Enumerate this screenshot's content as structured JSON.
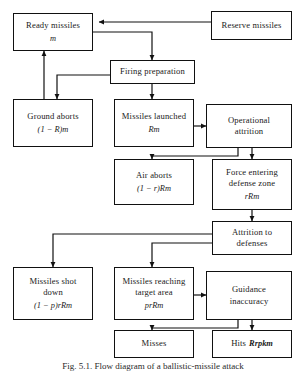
{
  "figure": {
    "caption_prefix": "Fig. 5.1.",
    "caption_text": "Flow diagram of a ballistic-missile attack",
    "background_color": "#ffffff",
    "line_color": "#111111"
  },
  "nodes": {
    "ready_missiles": {
      "label": "Ready missiles",
      "formula": "m"
    },
    "reserve_missiles": {
      "label": "Reserve missiles",
      "formula": ""
    },
    "firing_preparation": {
      "label": "Firing preparation",
      "formula": ""
    },
    "ground_aborts": {
      "label": "Ground aborts",
      "formula": "(1 − R)m"
    },
    "missiles_launched": {
      "label": "Missiles launched",
      "formula": "Rm"
    },
    "operational_attrition": {
      "label_line1": "Operational",
      "label_line2": "attrition",
      "formula": ""
    },
    "air_aborts": {
      "label": "Air aborts",
      "formula": "(1 − r)Rm"
    },
    "force_entering_defense_zone": {
      "label_line1": "Force entering",
      "label_line2": "defense zone",
      "formula": "rRm"
    },
    "attrition_to_defenses": {
      "label_line1": "Attrition to",
      "label_line2": "defenses",
      "formula": ""
    },
    "missiles_shot_down": {
      "label_line1": "Missiles shot",
      "label_line2": "down",
      "formula": "(1 − p)rRm"
    },
    "missiles_reaching_target_area": {
      "label_line1": "Missiles reaching",
      "label_line2": "target area",
      "formula": "prRm"
    },
    "guidance_inaccuracy": {
      "label_line1": "Guidance",
      "label_line2": "inaccuracy",
      "formula": ""
    },
    "misses": {
      "label": "Misses",
      "formula": ""
    },
    "hits": {
      "label": "Hits",
      "formula": "Rrpkm"
    }
  },
  "edges": [
    {
      "name": "reserve-to-ready",
      "from": "reserve_missiles",
      "to": "ready_missiles"
    },
    {
      "name": "ready-to-firing-preparation",
      "from": "ready_missiles",
      "to": "firing_preparation"
    },
    {
      "name": "firing-preparation-to-ground-aborts",
      "from": "firing_preparation",
      "to": "ground_aborts"
    },
    {
      "name": "firing-preparation-to-missiles-launched",
      "from": "firing_preparation",
      "to": "missiles_launched"
    },
    {
      "name": "ground-aborts-to-ready",
      "from": "ground_aborts",
      "to": "ready_missiles"
    },
    {
      "name": "missiles-launched-to-operational-attrition",
      "from": "missiles_launched",
      "to": "operational_attrition"
    },
    {
      "name": "operational-attrition-to-air-aborts",
      "from": "operational_attrition",
      "to": "air_aborts"
    },
    {
      "name": "operational-attrition-to-force-entering",
      "from": "operational_attrition",
      "to": "force_entering_defense_zone"
    },
    {
      "name": "force-entering-to-attrition-to-defenses",
      "from": "force_entering_defense_zone",
      "to": "attrition_to_defenses"
    },
    {
      "name": "attrition-to-defenses-to-missiles-shot-down",
      "from": "attrition_to_defenses",
      "to": "missiles_shot_down"
    },
    {
      "name": "attrition-to-defenses-to-missiles-reaching",
      "from": "attrition_to_defenses",
      "to": "missiles_reaching_target_area"
    },
    {
      "name": "missiles-reaching-to-guidance-inaccuracy",
      "from": "missiles_reaching_target_area",
      "to": "guidance_inaccuracy"
    },
    {
      "name": "guidance-inaccuracy-to-misses",
      "from": "guidance_inaccuracy",
      "to": "misses"
    },
    {
      "name": "guidance-inaccuracy-to-hits",
      "from": "guidance_inaccuracy",
      "to": "hits"
    }
  ]
}
